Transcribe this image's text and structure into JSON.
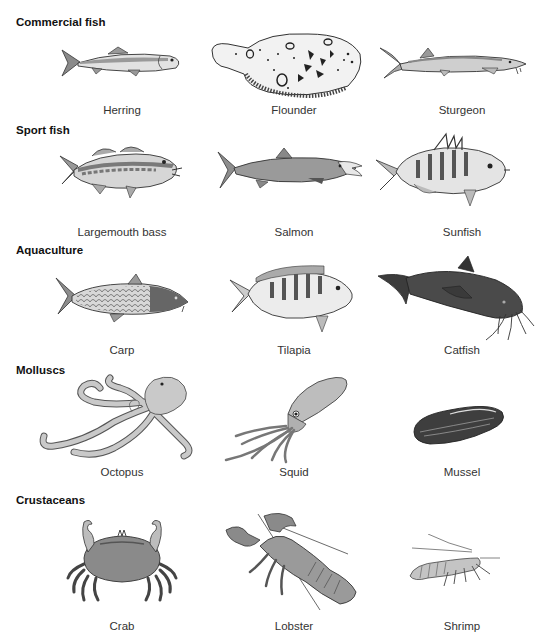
{
  "sections": [
    {
      "heading": "Commercial fish",
      "items": [
        {
          "name": "Herring",
          "icon": "herring-icon"
        },
        {
          "name": "Flounder",
          "icon": "flounder-icon"
        },
        {
          "name": "Sturgeon",
          "icon": "sturgeon-icon"
        }
      ]
    },
    {
      "heading": "Sport fish",
      "items": [
        {
          "name": "Largemouth bass",
          "icon": "largemouth-bass-icon"
        },
        {
          "name": "Salmon",
          "icon": "salmon-icon"
        },
        {
          "name": "Sunfish",
          "icon": "sunfish-icon"
        }
      ]
    },
    {
      "heading": "Aquaculture",
      "items": [
        {
          "name": "Carp",
          "icon": "carp-icon"
        },
        {
          "name": "Tilapia",
          "icon": "tilapia-icon"
        },
        {
          "name": "Catfish",
          "icon": "catfish-icon"
        }
      ]
    },
    {
      "heading": "Molluscs",
      "items": [
        {
          "name": "Octopus",
          "icon": "octopus-icon"
        },
        {
          "name": "Squid",
          "icon": "squid-icon"
        },
        {
          "name": "Mussel",
          "icon": "mussel-icon"
        }
      ]
    },
    {
      "heading": "Crustaceans",
      "items": [
        {
          "name": "Crab",
          "icon": "crab-icon"
        },
        {
          "name": "Lobster",
          "icon": "lobster-icon"
        },
        {
          "name": "Shrimp",
          "icon": "shrimp-icon"
        }
      ]
    }
  ],
  "colors": {
    "light_fill": "#e8e8e8",
    "mid_fill": "#a8a8a8",
    "dark_fill": "#5a5a5a",
    "outline": "#333333"
  }
}
